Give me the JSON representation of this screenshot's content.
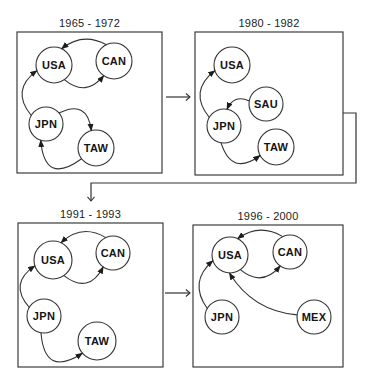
{
  "colors": {
    "background": "#ffffff",
    "line": "#333333",
    "box_border": "#3d3d3d",
    "node_fill": "#ffffff",
    "text": "#141414"
  },
  "panels": [
    {
      "id": "1",
      "title": "1965 - 1972",
      "box": {
        "x": 17,
        "y": 32,
        "w": 145,
        "h": 141
      },
      "nodes": [
        {
          "id": "USA",
          "label": "USA",
          "x": 54,
          "y": 65,
          "r": 18
        },
        {
          "id": "CAN",
          "label": "CAN",
          "x": 114,
          "y": 61,
          "r": 18
        },
        {
          "id": "JPN",
          "label": "JPN",
          "x": 46,
          "y": 124,
          "r": 17
        },
        {
          "id": "TAW",
          "label": "TAW",
          "x": 96,
          "y": 148,
          "r": 18
        }
      ],
      "edges": [
        {
          "from": "CAN",
          "to": "USA",
          "a1": -115,
          "a2": -65,
          "bend": -15
        },
        {
          "from": "USA",
          "to": "CAN",
          "a1": 55,
          "a2": 125,
          "bend": -20
        },
        {
          "from": "JPN",
          "to": "USA",
          "a1": -150,
          "a2": 162,
          "bend": 24
        },
        {
          "from": "JPN",
          "to": "TAW",
          "a1": -40,
          "a2": -105,
          "bend": 26
        },
        {
          "from": "TAW",
          "to": "JPN",
          "a1": 143,
          "a2": 108,
          "bend": 40
        }
      ]
    },
    {
      "id": "2",
      "title": "1980 - 1982",
      "box": {
        "x": 195,
        "y": 32,
        "w": 148,
        "h": 143
      },
      "nodes": [
        {
          "id": "USA",
          "label": "USA",
          "x": 232,
          "y": 65,
          "r": 18
        },
        {
          "id": "SAU",
          "label": "SAU",
          "x": 266,
          "y": 104,
          "r": 17
        },
        {
          "id": "JPN",
          "label": "JPN",
          "x": 224,
          "y": 126,
          "r": 17
        },
        {
          "id": "TAW",
          "label": "TAW",
          "x": 276,
          "y": 147,
          "r": 18
        }
      ],
      "edges": [
        {
          "from": "JPN",
          "to": "USA",
          "a1": -150,
          "a2": 162,
          "bend": 24
        },
        {
          "from": "SAU",
          "to": "JPN",
          "a1": -170,
          "a2": -80,
          "bend": -12
        },
        {
          "from": "JPN",
          "to": "TAW",
          "a1": 100,
          "a2": 152,
          "bend": -29
        }
      ]
    },
    {
      "id": "3",
      "title": "1991 - 1993",
      "box": {
        "x": 18,
        "y": 223,
        "w": 145,
        "h": 144
      },
      "nodes": [
        {
          "id": "USA",
          "label": "USA",
          "x": 53,
          "y": 260,
          "r": 19
        },
        {
          "id": "CAN",
          "label": "CAN",
          "x": 113,
          "y": 253,
          "r": 17
        },
        {
          "id": "JPN",
          "label": "JPN",
          "x": 44,
          "y": 316,
          "r": 17
        },
        {
          "id": "TAW",
          "label": "TAW",
          "x": 97,
          "y": 341,
          "r": 19
        }
      ],
      "edges": [
        {
          "from": "CAN",
          "to": "USA",
          "a1": -115,
          "a2": -65,
          "bend": -17
        },
        {
          "from": "USA",
          "to": "CAN",
          "a1": 55,
          "a2": 125,
          "bend": -24
        },
        {
          "from": "JPN",
          "to": "USA",
          "a1": -150,
          "a2": 162,
          "bend": 24
        },
        {
          "from": "JPN",
          "to": "TAW",
          "a1": 100,
          "a2": 140,
          "bend": -39
        }
      ]
    },
    {
      "id": "4",
      "title": "1996 - 2000",
      "box": {
        "x": 193,
        "y": 225,
        "w": 150,
        "h": 142
      },
      "nodes": [
        {
          "id": "USA",
          "label": "USA",
          "x": 230,
          "y": 255,
          "r": 18
        },
        {
          "id": "CAN",
          "label": "CAN",
          "x": 290,
          "y": 252,
          "r": 17
        },
        {
          "id": "JPN",
          "label": "JPN",
          "x": 222,
          "y": 317,
          "r": 17
        },
        {
          "id": "MEX",
          "label": "MEX",
          "x": 314,
          "y": 317,
          "r": 17
        }
      ],
      "edges": [
        {
          "from": "CAN",
          "to": "USA",
          "a1": -115,
          "a2": -65,
          "bend": -15
        },
        {
          "from": "USA",
          "to": "CAN",
          "a1": 55,
          "a2": 125,
          "bend": -20
        },
        {
          "from": "JPN",
          "to": "USA",
          "a1": -150,
          "a2": 162,
          "bend": 22
        },
        {
          "from": "MEX",
          "to": "USA",
          "a1": 187,
          "a2": 92,
          "bend": 20
        }
      ]
    }
  ],
  "connectors": [
    {
      "name": "connector-panel1-to-panel2",
      "points": [
        [
          166,
          97
        ],
        [
          190,
          97
        ]
      ]
    },
    {
      "name": "connector-panel2-to-panel3",
      "points": [
        [
          343,
          113
        ],
        [
          356,
          113
        ],
        [
          356,
          183
        ],
        [
          91,
          183
        ],
        [
          91,
          201
        ]
      ]
    },
    {
      "name": "connector-panel3-to-panel4",
      "points": [
        [
          165,
          293
        ],
        [
          190,
          293
        ]
      ]
    }
  ]
}
